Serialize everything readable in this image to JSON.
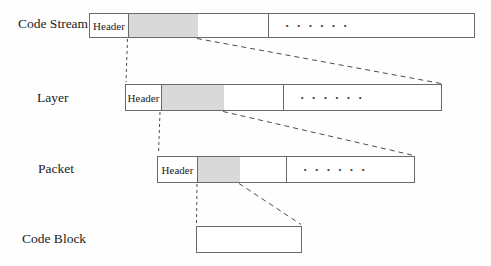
{
  "diagram": {
    "rows": [
      {
        "label": "Code Stream",
        "header_label": "Header",
        "dots": "· · · · · ·"
      },
      {
        "label": "Layer",
        "header_label": "Header",
        "dots": "· · · · · ·"
      },
      {
        "label": "Packet",
        "header_label": "Header",
        "dots": "· · · · · ·"
      },
      {
        "label": "Code Block"
      }
    ],
    "colors": {
      "shaded_segment": "#d9d9d9",
      "bar_border": "#6a6a6a",
      "dashed_line": "#4d4d4d",
      "background": "#fefefe"
    }
  }
}
